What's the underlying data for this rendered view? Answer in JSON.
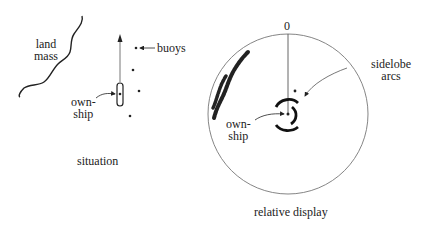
{
  "situation": {
    "caption": "situation",
    "land_label_line1": "land",
    "land_label_line2": "mass",
    "buoys_label": "buoys",
    "ownship_label_line1": "own-",
    "ownship_label_line2": "ship",
    "buoy_count": 4
  },
  "relative_display": {
    "caption": "relative display",
    "bearing_zero_label": "0",
    "sidelobe_label_line1": "sidelobe",
    "sidelobe_label_line2": "arcs",
    "ownship_label_line1": "own-",
    "ownship_label_line2": "ship"
  },
  "colors": {
    "ink": "#222222",
    "circle": "#777777",
    "heading_line": "#555555"
  }
}
